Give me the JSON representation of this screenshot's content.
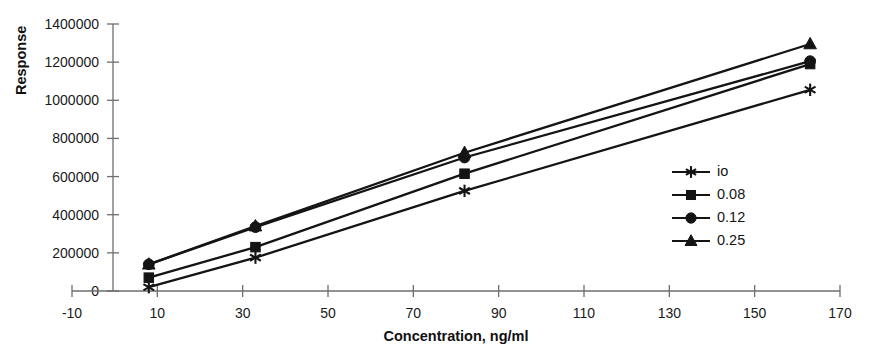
{
  "chart_data": {
    "type": "line",
    "title": "",
    "xlabel": "Concentration, ng/ml",
    "ylabel": "Response",
    "xlim": [
      -10,
      170
    ],
    "ylim": [
      0,
      1400000
    ],
    "xticks": [
      -10,
      10,
      30,
      50,
      70,
      90,
      110,
      130,
      150,
      170
    ],
    "xtick_labels": [
      "-10",
      "10",
      "30",
      "50",
      "70",
      "90",
      "110",
      "130",
      "150",
      "170"
    ],
    "yticks": [
      0,
      200000,
      400000,
      600000,
      800000,
      1000000,
      1200000,
      1400000
    ],
    "ytick_labels": [
      "0",
      "200000",
      "400000",
      "600000",
      "800000",
      "1000000",
      "1200000",
      "1400000"
    ],
    "grid": false,
    "legend_position": "right-middle",
    "x": [
      8,
      33,
      82,
      163
    ],
    "series": [
      {
        "name": "io",
        "marker": "star",
        "values": [
          20000,
          175000,
          525000,
          1055000
        ]
      },
      {
        "name": "0.08",
        "marker": "square",
        "values": [
          70000,
          230000,
          615000,
          1190000
        ]
      },
      {
        "name": "0.12",
        "marker": "circle",
        "values": [
          140000,
          335000,
          700000,
          1205000
        ]
      },
      {
        "name": "0.25",
        "marker": "triangle",
        "values": [
          140000,
          340000,
          725000,
          1295000
        ]
      }
    ],
    "colors": {
      "line": "#141414",
      "marker": "#141414",
      "axis": "#6e6e6e",
      "text": "#1a1a1a",
      "background": "#ffffff"
    }
  },
  "legend": {
    "entries": [
      {
        "label": "io"
      },
      {
        "label": "0.08"
      },
      {
        "label": "0.12"
      },
      {
        "label": "0.25"
      }
    ]
  }
}
